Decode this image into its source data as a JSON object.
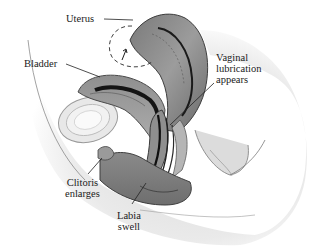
{
  "figure": {
    "colors": {
      "background": "#ffffff",
      "tissue_light": "#d9d9d9",
      "tissue_mid": "#9a9a9a",
      "tissue_dark": "#4a4a4a",
      "cavity": "#141414",
      "leader_line": "#222222",
      "text": "#1a1a1a"
    },
    "labels": [
      {
        "id": "uterus",
        "text": "Uterus"
      },
      {
        "id": "bladder",
        "text": "Bladder"
      },
      {
        "id": "vaginal_lubrication",
        "text": "Vaginal\nlubrication\nappears"
      },
      {
        "id": "clitoris",
        "text": "Clitoris\nenlarges"
      },
      {
        "id": "labia",
        "text": "Labia\nswell"
      }
    ]
  }
}
